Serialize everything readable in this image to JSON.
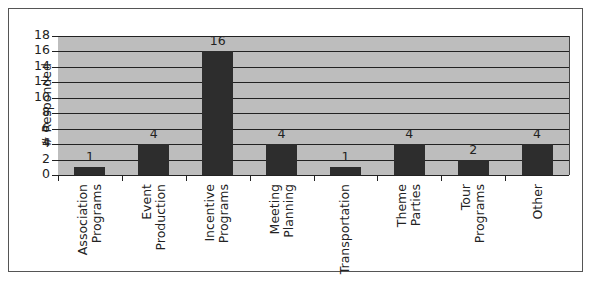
{
  "chart_data": {
    "type": "bar",
    "title": "",
    "xlabel": "",
    "ylabel": "# Responded",
    "ylim": [
      0,
      18
    ],
    "yticks": [
      0,
      2,
      4,
      6,
      8,
      10,
      12,
      14,
      16,
      18
    ],
    "grid": true,
    "legend": null,
    "categories": [
      "Association Programs",
      "Event Production",
      "Incentive Programs",
      "Meeting Planning",
      "Transportation",
      "Theme Parties",
      "Tour Programs",
      "Other"
    ],
    "category_labels": [
      "Association\nPrograms",
      "Event\nProduction",
      "Incentive\nPrograms",
      "Meeting\nPlanning",
      "Transportation",
      "Theme\nParties",
      "Tour\nPrograms",
      "Other"
    ],
    "values": [
      1,
      4,
      16,
      4,
      1,
      4,
      2,
      4
    ],
    "data_labels": [
      "1",
      "4",
      "16",
      "4",
      "1",
      "4",
      "2",
      "4"
    ],
    "colors": {
      "bar": "#2d2d2d",
      "plot_bg": "#bdbdbd",
      "grid": "#222222"
    }
  }
}
